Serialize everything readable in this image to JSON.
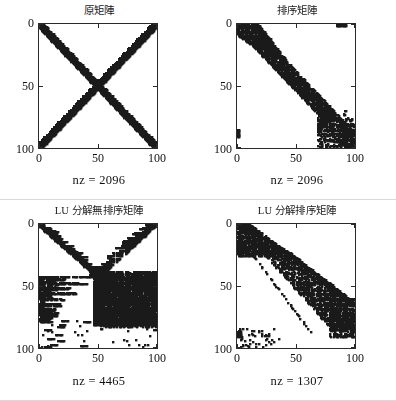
{
  "figure": {
    "width": 396,
    "height": 401,
    "background": "#ffffff",
    "ink_color": "#1a1a1a",
    "axis_color": "#2a2a2a"
  },
  "chart_data": [
    {
      "type": "scatter",
      "id": "original-matrix",
      "title": "原矩陣",
      "xlabel": "",
      "ylabel": "",
      "annotation": "nz = 2096",
      "nz": 2096,
      "xlim": [
        0,
        100
      ],
      "ylim": [
        100,
        0
      ],
      "xticks": [
        0,
        50,
        100
      ],
      "yticks": [
        0,
        50,
        100
      ],
      "xticklabels": [
        "0",
        "50",
        "100"
      ],
      "yticklabels": [
        "0",
        "50",
        "100"
      ],
      "grid": false,
      "legend": "none",
      "pattern": "x-cross",
      "description": "Sparse matrix sparsity pattern: two thick crossing diagonal bands forming an X from corner to corner, 100x100 grid, band half-width about 3 diagonals."
    },
    {
      "type": "scatter",
      "id": "permuted-matrix",
      "title": "排序矩陣",
      "xlabel": "",
      "ylabel": "",
      "annotation": "nz = 2096",
      "nz": 2096,
      "xlim": [
        0,
        100
      ],
      "ylim": [
        100,
        0
      ],
      "xticks": [
        0,
        50,
        100
      ],
      "yticks": [
        0,
        50,
        100
      ],
      "xticklabels": [
        "0",
        "50",
        "100"
      ],
      "yticklabels": [
        "0",
        "50",
        "100"
      ],
      "grid": false,
      "legend": "none",
      "pattern": "banded-diagonal",
      "description": "Reordered sparse matrix: one thick main diagonal band from upper-left to lower-right with scattered arrow-head fill-in cluster near the lower-right corner, small marks at top-right and left edge near row 88."
    },
    {
      "type": "scatter",
      "id": "lu-unpermuted",
      "title": "LU 分解無排序矩陣",
      "xlabel": "",
      "ylabel": "",
      "annotation": "nz = 4465",
      "nz": 4465,
      "xlim": [
        0,
        100
      ],
      "ylim": [
        100,
        0
      ],
      "xticks": [
        0,
        50,
        100
      ],
      "yticks": [
        0,
        50,
        100
      ],
      "xticklabels": [
        "0",
        "50",
        "100"
      ],
      "yticklabels": [
        "0",
        "50",
        "100"
      ],
      "grid": false,
      "legend": "none",
      "pattern": "lu-fillin-dense",
      "description": "LU factors of the unordered matrix: heavy fill-in, V-shaped converging bands meeting near column 50 / row 42, dense solid block filling the lower-right region, ragged horizontal streaks on the left, sparse scattered dots below row 80."
    },
    {
      "type": "scatter",
      "id": "lu-permuted",
      "title": "LU 分解排序矩陣",
      "xlabel": "",
      "ylabel": "",
      "annotation": "nz = 1307",
      "nz": 1307,
      "xlim": [
        0,
        100
      ],
      "ylim": [
        100,
        0
      ],
      "xticks": [
        0,
        50,
        100
      ],
      "yticks": [
        0,
        50,
        100
      ],
      "xticklabels": [
        "0",
        "50",
        "100"
      ],
      "yticklabels": [
        "0",
        "50",
        "100"
      ],
      "grid": false,
      "legend": "none",
      "pattern": "lu-fillin-sparse",
      "description": "LU factors after reordering: much less fill-in, a broad staircase band descending from upper-left to lower-right, a thin dotted sub-diagonal line below the band, scattered marks near the lower-left corner."
    }
  ]
}
